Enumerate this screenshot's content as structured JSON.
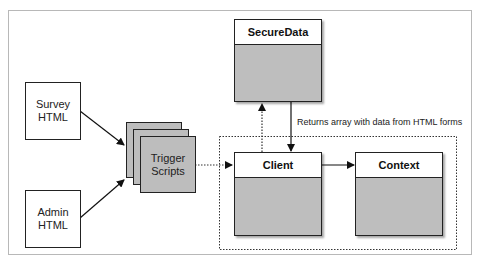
{
  "diagram": {
    "nodes": {
      "survey_html": {
        "line1": "Survey",
        "line2": "HTML"
      },
      "admin_html": {
        "line1": "Admin",
        "line2": "HTML"
      },
      "trigger_scripts": {
        "line1": "Trigger",
        "line2": "Scripts"
      },
      "secure_data": {
        "title": "SecureData"
      },
      "client": {
        "title": "Client"
      },
      "context": {
        "title": "Context"
      }
    },
    "edges": [
      {
        "from": "Survey HTML",
        "to": "Trigger Scripts",
        "style": "solid"
      },
      {
        "from": "Admin HTML",
        "to": "Trigger Scripts",
        "style": "solid"
      },
      {
        "from": "Trigger Scripts",
        "to": "Client",
        "style": "dotted"
      },
      {
        "from": "Client",
        "to": "SecureData",
        "style": "dotted"
      },
      {
        "from": "SecureData",
        "to": "Client",
        "style": "solid",
        "label": "Returns array with data from HTML forms"
      },
      {
        "from": "Client",
        "to": "Context",
        "style": "solid"
      }
    ],
    "return_label": "Returns array with data from HTML forms",
    "colors": {
      "class_body": "#bebebe",
      "header": "#ffffff",
      "stroke": "#222222",
      "frame": "#b8b8b8"
    }
  }
}
